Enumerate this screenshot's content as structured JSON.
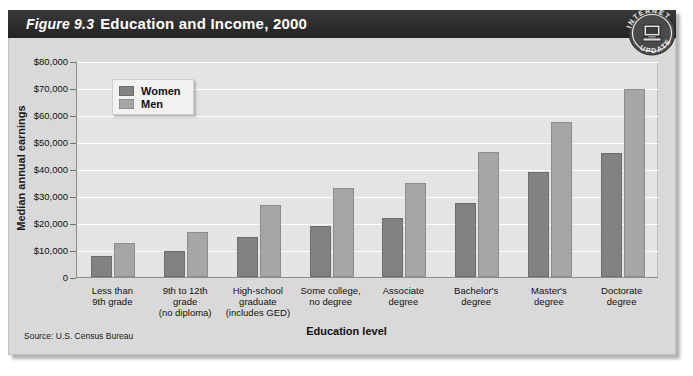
{
  "figure": {
    "number": "Figure 9.3",
    "title": "Education and Income, 2000",
    "source": "Source: U.S. Census Bureau",
    "badge": {
      "top_text": "INTERNET",
      "bottom_text": "UPDATE",
      "icon": "computer-icon"
    }
  },
  "colors": {
    "women": "#828282",
    "men": "#a6a6a6",
    "plot_background": "#e4e4e4",
    "card_background": "#d9d9d9",
    "titlebar": "#2b2b2b",
    "gridline": "#ffffff"
  },
  "chart_data": {
    "type": "bar",
    "title": "Education and Income, 2000",
    "xlabel": "Education level",
    "ylabel": "Median annual earnings",
    "ylim": [
      0,
      80000
    ],
    "ytick_values": [
      0,
      10000,
      20000,
      30000,
      40000,
      50000,
      60000,
      70000,
      80000
    ],
    "ytick_labels": [
      "0",
      "$10,000",
      "$20,000",
      "$30,000",
      "$40,000",
      "$50,000",
      "$60,000",
      "$70,000",
      "$80,000"
    ],
    "grid": true,
    "legend_position": "upper-left",
    "categories": [
      "Less than\n9th grade",
      "9th to 12th\ngrade\n(no diploma)",
      "High-school\ngraduate\n(includes GED)",
      "Some college,\nno degree",
      "Associate\ndegree",
      "Bachelor's\ndegree",
      "Master's\ndegree",
      "Doctorate\ndegree"
    ],
    "category_lines": [
      [
        "Less than",
        "9th grade"
      ],
      [
        "9th to 12th",
        "grade",
        "(no diploma)"
      ],
      [
        "High-school",
        "graduate",
        "(includes GED)"
      ],
      [
        "Some college,",
        "no degree"
      ],
      [
        "Associate",
        "degree"
      ],
      [
        "Bachelor's",
        "degree"
      ],
      [
        "Master's",
        "degree"
      ],
      [
        "Doctorate",
        "degree"
      ]
    ],
    "series": [
      {
        "name": "Women",
        "color": "#828282",
        "values": [
          7800,
          9500,
          14800,
          19000,
          22000,
          27500,
          38800,
          45800
        ]
      },
      {
        "name": "Men",
        "color": "#a6a6a6",
        "values": [
          12700,
          16800,
          26500,
          33000,
          35000,
          46200,
          57500,
          69800
        ]
      }
    ]
  }
}
